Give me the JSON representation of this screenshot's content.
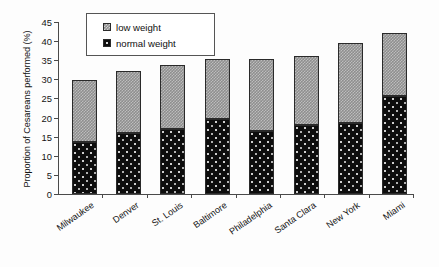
{
  "chart_data": {
    "type": "bar",
    "subtype": "stacked-bar",
    "title": "",
    "xlabel": "",
    "ylabel": "Proportion of Cesareans performed (%)",
    "ylim": [
      0,
      45
    ],
    "ytick_step": 5,
    "yticks": [
      "0",
      "5",
      "10",
      "15",
      "20",
      "25",
      "30",
      "35",
      "40",
      "45"
    ],
    "grid": false,
    "legend_position": "top-center",
    "categories": [
      "Milwaukee",
      "Denver",
      "St. Louis",
      "Baltimore",
      "Philadelphia",
      "Santa Clara",
      "New York",
      "Miami"
    ],
    "series": [
      {
        "name": "normal weight",
        "color": "#0d0d0d",
        "pattern": "black-with-white-dots",
        "values": [
          13.6,
          15.9,
          17.1,
          19.6,
          16.6,
          18.1,
          18.7,
          25.7
        ]
      },
      {
        "name": "low weight",
        "color": "#8e8e8e",
        "pattern": "gray-checker",
        "values": [
          16.2,
          16.2,
          16.7,
          15.6,
          18.7,
          18.1,
          20.8,
          16.4
        ]
      }
    ],
    "totals": [
      29.8,
      32.1,
      33.8,
      35.2,
      35.3,
      36.2,
      39.5,
      42.1
    ],
    "stack_order": [
      "normal weight",
      "low weight"
    ]
  },
  "legend": {
    "items": [
      {
        "label": "low weight",
        "swatch": "low-weight-swatch"
      },
      {
        "label": "normal weight",
        "swatch": "normal-weight-swatch"
      }
    ]
  }
}
